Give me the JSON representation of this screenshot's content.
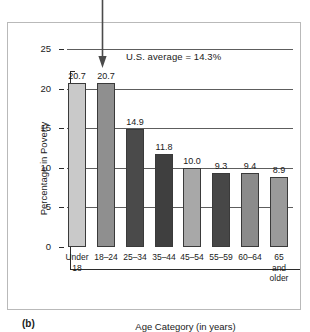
{
  "figure": {
    "panel_letter": "(b)",
    "annotation": "U.S. average = 14.3%",
    "arrow_icon": "down-arrow-icon"
  },
  "chart_data": {
    "type": "bar",
    "title": "",
    "xlabel": "Age Category (in years)",
    "ylabel": "Percentage in Poverty",
    "categories": [
      "Under 18",
      "18–24",
      "25–34",
      "35–44",
      "45–54",
      "55–59",
      "60–64",
      "65 and older"
    ],
    "category_display": [
      "Under\n18",
      "18–24",
      "25–34",
      "35–44",
      "45–54",
      "55–59",
      "60–64",
      "65\nand\nolder"
    ],
    "values": [
      20.7,
      20.7,
      14.9,
      11.8,
      10.0,
      9.3,
      9.4,
      8.9
    ],
    "value_labels": [
      "20.7",
      "20.7",
      "14.9",
      "11.8",
      "10.0",
      "9.3",
      "9.4",
      "8.9"
    ],
    "bar_colors": [
      "#c9c9c9",
      "#8f8f8f",
      "#4a4a4a",
      "#3f3f3f",
      "#a8a8a8",
      "#474747",
      "#8b8b8b",
      "#9a9a9a"
    ],
    "ylim": [
      0,
      25
    ],
    "yticks": [
      0,
      5,
      10,
      15,
      20,
      25
    ],
    "ytick_labels": [
      "0",
      "5",
      "10",
      "15",
      "20",
      "25"
    ],
    "grid": "horizontal",
    "legend": "none",
    "annotations": [
      {
        "text": "U.S. average = 14.3%",
        "value": 14.3
      }
    ]
  }
}
